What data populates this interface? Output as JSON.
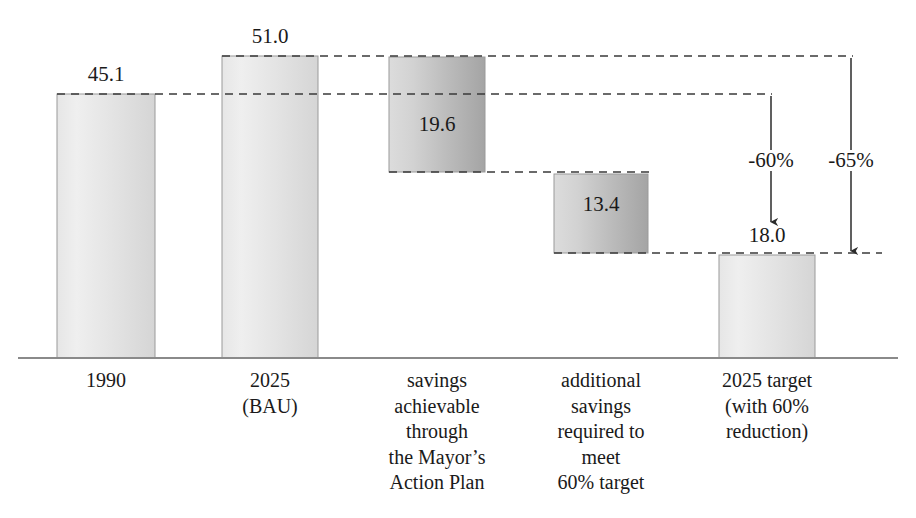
{
  "chart_data": {
    "type": "bar",
    "subtype": "waterfall",
    "title": "",
    "subtitle": "",
    "xlabel": "",
    "ylabel": "",
    "ylim": [
      0,
      57
    ],
    "grid": false,
    "legend": null,
    "units": "MtCO2",
    "categories": [
      "1990",
      "2025 (BAU)",
      "savings achievable through the Mayor’s Action Plan",
      "additional savings required to meet 60% target",
      "2025 target (with 60% reduction)"
    ],
    "values": [
      45.1,
      51.0,
      19.6,
      13.4,
      18.0
    ],
    "value_labels": [
      "45.1",
      "51.0",
      "19.6",
      "13.4",
      "18.0"
    ],
    "bar_types": [
      "total",
      "total",
      "decrease",
      "decrease",
      "total"
    ],
    "bar_bases": [
      0,
      0,
      31.4,
      18.0,
      0
    ],
    "bar_tops": [
      45.1,
      51.0,
      51.0,
      31.4,
      18.0
    ],
    "connector_levels": [
      45.1,
      51.0,
      31.4,
      18.0
    ],
    "annotations": [
      {
        "label": "-60%",
        "from": 45.1,
        "to": 18.0
      },
      {
        "label": "-65%",
        "from": 51.0,
        "to": 18.0
      }
    ]
  },
  "bars": [
    {
      "name": "bar-1990",
      "value_label": "45.1",
      "x": 57,
      "width": 98,
      "top": 94,
      "bottom": 358,
      "label_x": 57,
      "label_width": 98,
      "label_y": 64,
      "label_inside": false
    },
    {
      "name": "bar-2025-bau",
      "value_label": "51.0",
      "x": 222,
      "width": 96,
      "top": 56,
      "bottom": 358,
      "label_x": 222,
      "label_width": 96,
      "label_y": 26,
      "label_inside": false
    },
    {
      "name": "bar-savings-action-plan",
      "value_label": "19.6",
      "x": 389,
      "width": 96,
      "top": 57,
      "bottom": 172,
      "label_x": 389,
      "label_width": 96,
      "label_y": 114,
      "label_inside": true
    },
    {
      "name": "bar-additional-savings",
      "value_label": "13.4",
      "x": 554,
      "width": 94,
      "top": 174,
      "bottom": 253,
      "label_x": 554,
      "label_width": 94,
      "label_y": 194,
      "label_inside": true
    },
    {
      "name": "bar-2025-target",
      "value_label": "18.0",
      "x": 719,
      "width": 96,
      "top": 255,
      "bottom": 358,
      "label_x": 719,
      "label_width": 96,
      "label_y": 225,
      "label_inside": false
    }
  ],
  "connectors": [
    {
      "name": "connector-45-1",
      "y": 94,
      "x1": 57,
      "x2": 772
    },
    {
      "name": "connector-51-0",
      "y": 56,
      "x1": 222,
      "x2": 853
    },
    {
      "name": "connector-31-4",
      "y": 172,
      "x1": 389,
      "x2": 650
    },
    {
      "name": "connector-18-0",
      "y": 253,
      "x1": 554,
      "x2": 882
    }
  ],
  "arrows": [
    {
      "name": "arrow-60-percent",
      "label": "-60%",
      "x": 771,
      "y1": 96,
      "y2": 222,
      "label_x": 726,
      "label_width": 90,
      "label_y": 150
    },
    {
      "name": "arrow-65-percent",
      "label": "-65%",
      "x": 851,
      "y1": 58,
      "y2": 251,
      "label_x": 806,
      "label_width": 90,
      "label_y": 150
    }
  ],
  "axis": {
    "name": "x-axis-line",
    "y": 358,
    "x1": 18,
    "x2": 898
  },
  "category_labels": [
    {
      "name": "x-label-1990",
      "x": 46,
      "width": 120,
      "y": 368,
      "lines": [
        "1990"
      ]
    },
    {
      "name": "x-label-2025-bau",
      "x": 210,
      "width": 120,
      "y": 368,
      "lines": [
        "2025",
        "(BAU)"
      ]
    },
    {
      "name": "x-label-savings-action-plan",
      "x": 367,
      "width": 140,
      "y": 368,
      "lines": [
        "savings",
        "achievable",
        "through",
        "the Mayor’s",
        "Action Plan"
      ]
    },
    {
      "name": "x-label-additional-savings",
      "x": 527,
      "width": 148,
      "y": 368,
      "lines": [
        "additional",
        "savings",
        "required to",
        "meet",
        "60% target"
      ]
    },
    {
      "name": "x-label-2025-target",
      "x": 693,
      "width": 148,
      "y": 368,
      "lines": [
        "2025 target",
        "(with 60%",
        "reduction)"
      ]
    }
  ],
  "style": {
    "bar_fill_light_top": "#ededed",
    "bar_fill_light_bottom": "#d8d8d8",
    "bar_fill_dark_top": "#e2e2e2",
    "bar_fill_dark_bottom": "#a6a6a6",
    "bar_stroke": "#9a9a9a",
    "connector_color": "#3a3a3a",
    "axis_color": "#8a8a8a",
    "arrow_color": "#2b2b2b",
    "text_color": "#1a1a1a"
  }
}
